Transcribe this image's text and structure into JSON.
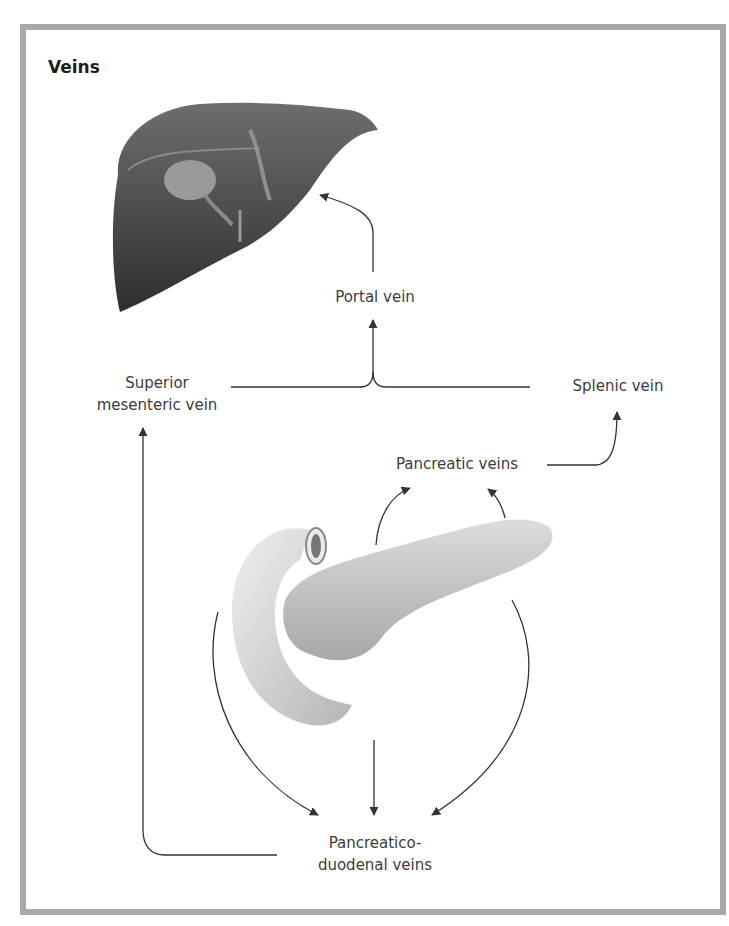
{
  "title": "Veins",
  "labels": {
    "portal_vein": "Portal vein",
    "superior_mesenteric_vein_line1": "Superior",
    "superior_mesenteric_vein_line2": "mesenteric vein",
    "splenic_vein": "Splenic vein",
    "pancreatic_veins": "Pancreatic veins",
    "pancreaticoduodenal_veins_line1": "Pancreatico-",
    "pancreaticoduodenal_veins_line2": "duodenal veins"
  },
  "illustrations": [
    "liver",
    "pancreas-and-duodenum"
  ],
  "flows": [
    {
      "from": "Pancreaticoduodenal veins",
      "to": "Superior mesenteric vein"
    },
    {
      "from": "Superior mesenteric vein",
      "to": "Portal vein"
    },
    {
      "from": "Splenic vein",
      "to": "Portal vein"
    },
    {
      "from": "Portal vein",
      "to": "Liver"
    },
    {
      "from": "Pancreas",
      "to": "Pancreatic veins"
    },
    {
      "from": "Pancreatic veins",
      "to": "Splenic vein"
    },
    {
      "from": "Pancreas",
      "to": "Pancreaticoduodenal veins"
    }
  ],
  "colors": {
    "frame": "#a9a9a9",
    "arrow": "#333333",
    "liver": "#4a4a4a",
    "pancreas": "#c8c8c8"
  }
}
